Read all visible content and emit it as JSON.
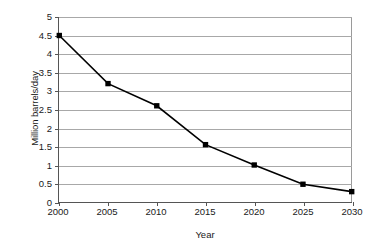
{
  "chart_data": {
    "type": "line",
    "title": "",
    "xlabel": "Year",
    "ylabel": "Million barrels/day",
    "x": [
      2000,
      2005,
      2010,
      2015,
      2020,
      2025,
      2030
    ],
    "categories": [
      "2000",
      "2005",
      "2010",
      "2015",
      "2020",
      "2025",
      "2030"
    ],
    "values": [
      4.5,
      3.2,
      2.6,
      1.55,
      1.0,
      0.48,
      0.28
    ],
    "series": [
      {
        "name": "Million barrels/day",
        "values": [
          4.5,
          3.2,
          2.6,
          1.55,
          1.0,
          0.48,
          0.28
        ]
      }
    ],
    "xlim": [
      2000,
      2030
    ],
    "ylim": [
      0,
      5
    ],
    "ytick_values": [
      0,
      0.5,
      1,
      1.5,
      2,
      2.5,
      3,
      3.5,
      4,
      4.5,
      5
    ],
    "ytick_labels": [
      "0",
      "0.5",
      "1",
      "1.5",
      "2",
      "2.5",
      "3",
      "3.5",
      "4",
      "4.5",
      "5"
    ],
    "xtick_labels": [
      "2000",
      "2005",
      "2010",
      "2015",
      "2020",
      "2025",
      "2030"
    ],
    "grid": true,
    "grid_axis": "y",
    "legend": false,
    "legend_position": "none",
    "marker": "square",
    "line_color": "#000000",
    "marker_color": "#000000",
    "grid_color": "#a8a8a8",
    "axis_color": "#555555",
    "background_color": "#ffffff"
  }
}
